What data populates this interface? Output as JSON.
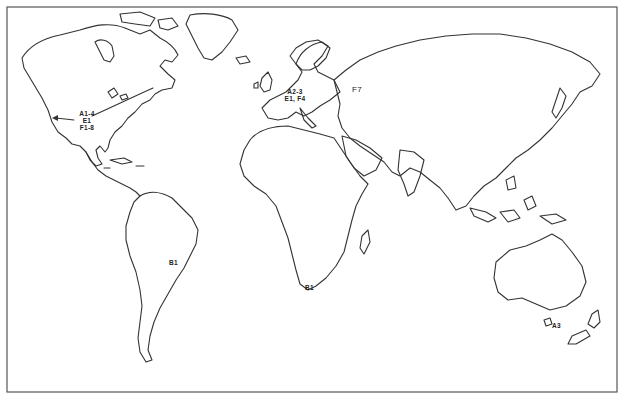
{
  "map": {
    "type": "world outline map",
    "frame_color": "#555555",
    "line_color": "#333333",
    "background": "#ffffff"
  },
  "labels": {
    "north_america": {
      "line1": "A1-4",
      "line2": "E1",
      "line3": "F1-8"
    },
    "europe": {
      "line1": "A2-3",
      "line2": "E1, F4"
    },
    "asia": {
      "line1": "F7"
    },
    "south_america": {
      "line1": "B1"
    },
    "africa": {
      "line1": "B1"
    },
    "tasmania": {
      "line1": "A3"
    }
  },
  "annotations": {
    "arrow": "arrow from eastern North America pointing west across the continent"
  }
}
